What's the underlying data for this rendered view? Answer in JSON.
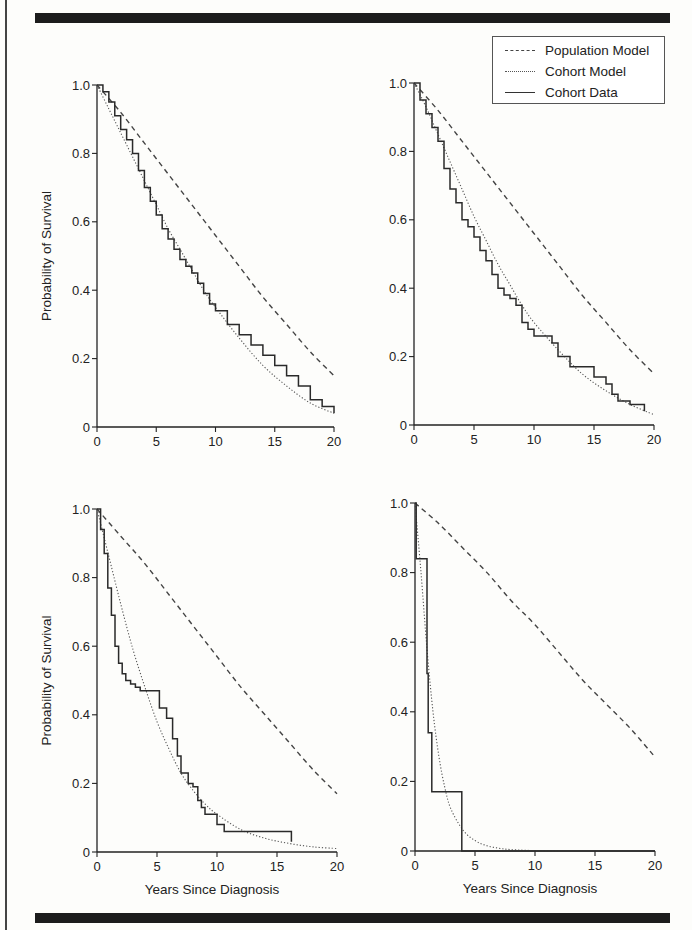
{
  "figure": {
    "legend": {
      "entries": [
        {
          "label": "Population Model",
          "style": "dashed"
        },
        {
          "label": "Cohort Model",
          "style": "dotted"
        },
        {
          "label": "Cohort Data",
          "style": "solid"
        }
      ]
    },
    "colors": {
      "ink": "#222222",
      "rule": "#1c1c1c",
      "background": "#fdfdfb"
    }
  },
  "chart_data": [
    {
      "type": "line",
      "panel": "top-left",
      "title": "",
      "xlabel": "",
      "ylabel": "Probability of Survival",
      "xlim": [
        0,
        20
      ],
      "ylim": [
        0,
        1.0
      ],
      "xticks": [
        "0",
        "5",
        "10",
        "15",
        "20"
      ],
      "yticks": [
        "0",
        "0.2",
        "0.4",
        "0.6",
        "0.8",
        "1.0"
      ],
      "grid": false,
      "legend_position": "none",
      "frame": {
        "x0": 97,
        "x1": 334,
        "y0": 427,
        "y1": 85
      },
      "series": [
        {
          "name": "Population Model",
          "style": "dashed",
          "x": [
            0,
            2,
            4,
            6,
            8,
            10,
            12,
            14,
            16,
            18,
            20
          ],
          "y": [
            1.0,
            0.92,
            0.83,
            0.74,
            0.65,
            0.56,
            0.47,
            0.38,
            0.3,
            0.22,
            0.15
          ]
        },
        {
          "name": "Cohort Model",
          "style": "dotted",
          "x": [
            0,
            1,
            2,
            3,
            4,
            5,
            6,
            7,
            8,
            9,
            10,
            12,
            14,
            16,
            18,
            20
          ],
          "y": [
            1.0,
            0.93,
            0.86,
            0.79,
            0.72,
            0.65,
            0.58,
            0.52,
            0.46,
            0.4,
            0.35,
            0.26,
            0.18,
            0.12,
            0.07,
            0.04
          ]
        },
        {
          "name": "Cohort Data",
          "style": "step",
          "x": [
            0,
            0.5,
            1,
            1.5,
            2,
            2.5,
            3,
            3.5,
            4,
            4.5,
            5,
            5.5,
            6,
            6.5,
            7,
            7.5,
            8,
            8.5,
            9,
            9.5,
            10,
            11,
            12,
            13,
            14,
            15,
            16,
            17,
            18,
            19,
            20
          ],
          "y": [
            1.0,
            0.98,
            0.95,
            0.91,
            0.87,
            0.84,
            0.8,
            0.75,
            0.7,
            0.66,
            0.62,
            0.58,
            0.55,
            0.52,
            0.49,
            0.47,
            0.45,
            0.42,
            0.39,
            0.36,
            0.34,
            0.3,
            0.27,
            0.24,
            0.21,
            0.18,
            0.15,
            0.12,
            0.08,
            0.06,
            0.04
          ]
        }
      ]
    },
    {
      "type": "line",
      "panel": "top-right",
      "title": "",
      "xlabel": "",
      "ylabel": "",
      "xlim": [
        0,
        20
      ],
      "ylim": [
        0,
        1.0
      ],
      "xticks": [
        "0",
        "5",
        "10",
        "15",
        "20"
      ],
      "yticks": [
        "0",
        "0.2",
        "0.4",
        "0.6",
        "0.8",
        "1.0"
      ],
      "grid": false,
      "legend_position": "upper right",
      "frame": {
        "x0": 414,
        "x1": 654,
        "y0": 425,
        "y1": 83
      },
      "series": [
        {
          "name": "Population Model",
          "style": "dashed",
          "x": [
            0,
            2,
            4,
            6,
            8,
            10,
            12,
            14,
            16,
            18,
            20
          ],
          "y": [
            1.0,
            0.92,
            0.83,
            0.74,
            0.65,
            0.56,
            0.47,
            0.38,
            0.3,
            0.22,
            0.15
          ]
        },
        {
          "name": "Cohort Model",
          "style": "dotted",
          "x": [
            0,
            1,
            2,
            3,
            4,
            5,
            6,
            7,
            8,
            9,
            10,
            12,
            14,
            16,
            18,
            20
          ],
          "y": [
            1.0,
            0.93,
            0.85,
            0.77,
            0.69,
            0.61,
            0.54,
            0.47,
            0.41,
            0.35,
            0.3,
            0.22,
            0.15,
            0.1,
            0.06,
            0.03
          ]
        },
        {
          "name": "Cohort Data",
          "style": "step",
          "x": [
            0,
            0.5,
            1,
            1.5,
            2,
            2.5,
            3,
            3.5,
            4,
            4.5,
            5,
            5.5,
            6,
            6.5,
            7,
            7.5,
            8,
            8.5,
            9,
            9.5,
            10,
            11,
            11.5,
            12,
            13,
            14,
            14.5,
            15,
            16,
            16.5,
            17,
            18,
            19,
            19.2
          ],
          "y": [
            1.0,
            0.95,
            0.91,
            0.87,
            0.83,
            0.75,
            0.69,
            0.65,
            0.6,
            0.58,
            0.55,
            0.51,
            0.48,
            0.44,
            0.4,
            0.38,
            0.37,
            0.35,
            0.3,
            0.28,
            0.26,
            0.26,
            0.24,
            0.2,
            0.17,
            0.17,
            0.17,
            0.14,
            0.12,
            0.09,
            0.07,
            0.06,
            0.06,
            0.04
          ]
        }
      ]
    },
    {
      "type": "line",
      "panel": "bottom-left",
      "title": "",
      "xlabel": "Years Since Diagnosis",
      "ylabel": "Probability of Survival",
      "xlim": [
        0,
        20
      ],
      "ylim": [
        0,
        1.0
      ],
      "xticks": [
        "0",
        "5",
        "10",
        "15",
        "20"
      ],
      "yticks": [
        "0",
        "0.2",
        "0.4",
        "0.6",
        "0.8",
        "1.0"
      ],
      "grid": false,
      "legend_position": "none",
      "frame": {
        "x0": 97,
        "x1": 337,
        "y0": 852,
        "y1": 509
      },
      "series": [
        {
          "name": "Population Model",
          "style": "dashed",
          "x": [
            0,
            2,
            4,
            6,
            8,
            10,
            12,
            14,
            16,
            18,
            20
          ],
          "y": [
            1.0,
            0.92,
            0.84,
            0.75,
            0.66,
            0.57,
            0.48,
            0.4,
            0.32,
            0.24,
            0.17
          ]
        },
        {
          "name": "Cohort Model",
          "style": "dotted",
          "x": [
            0,
            1,
            2,
            3,
            4,
            5,
            6,
            7,
            8,
            9,
            10,
            12,
            14,
            16,
            18,
            20
          ],
          "y": [
            1.0,
            0.86,
            0.72,
            0.59,
            0.48,
            0.38,
            0.3,
            0.23,
            0.18,
            0.14,
            0.11,
            0.065,
            0.04,
            0.025,
            0.015,
            0.01
          ]
        },
        {
          "name": "Cohort Data",
          "style": "step",
          "x": [
            0,
            0.3,
            0.6,
            0.9,
            1.2,
            1.5,
            1.8,
            2.1,
            2.4,
            2.8,
            3.2,
            3.6,
            4.0,
            4.4,
            5.2,
            5.8,
            6.3,
            6.7,
            7.0,
            7.3,
            7.6,
            8.0,
            8.4,
            8.7,
            9.0,
            9.3,
            10.0,
            10.6,
            16.2
          ],
          "y": [
            1.0,
            0.94,
            0.87,
            0.77,
            0.69,
            0.6,
            0.55,
            0.52,
            0.5,
            0.49,
            0.48,
            0.47,
            0.47,
            0.47,
            0.42,
            0.39,
            0.33,
            0.28,
            0.23,
            0.23,
            0.2,
            0.19,
            0.15,
            0.13,
            0.11,
            0.11,
            0.08,
            0.06,
            0.03
          ]
        }
      ]
    },
    {
      "type": "line",
      "panel": "bottom-right",
      "title": "",
      "xlabel": "Years Since Diagnosis",
      "ylabel": "",
      "xlim": [
        0,
        20
      ],
      "ylim": [
        0,
        1.0
      ],
      "xticks": [
        "0",
        "5",
        "10",
        "15",
        "20"
      ],
      "yticks": [
        "0",
        "0.2",
        "0.4",
        "0.6",
        "0.8",
        "1.0"
      ],
      "grid": false,
      "legend_position": "none",
      "frame": {
        "x0": 415,
        "x1": 655,
        "y0": 851,
        "y1": 503
      },
      "series": [
        {
          "name": "Population Model",
          "style": "dashed",
          "x": [
            0,
            2,
            4,
            6,
            8,
            10,
            12,
            14,
            16,
            18,
            20
          ],
          "y": [
            1.0,
            0.94,
            0.87,
            0.8,
            0.72,
            0.65,
            0.57,
            0.49,
            0.42,
            0.35,
            0.27
          ]
        },
        {
          "name": "Cohort Model",
          "style": "dotted",
          "x": [
            0,
            0.5,
            1,
            1.5,
            2,
            2.5,
            3,
            4,
            5,
            6,
            7,
            8,
            10,
            12
          ],
          "y": [
            1.0,
            0.8,
            0.58,
            0.4,
            0.27,
            0.18,
            0.12,
            0.06,
            0.03,
            0.015,
            0.008,
            0.004,
            0.001,
            0.0
          ]
        },
        {
          "name": "Cohort Data",
          "style": "step",
          "x": [
            0,
            0.1,
            1.0,
            1.1,
            1.4,
            3.9,
            20
          ],
          "y": [
            1.0,
            0.84,
            0.51,
            0.34,
            0.17,
            0.0,
            0.0
          ]
        }
      ]
    }
  ]
}
